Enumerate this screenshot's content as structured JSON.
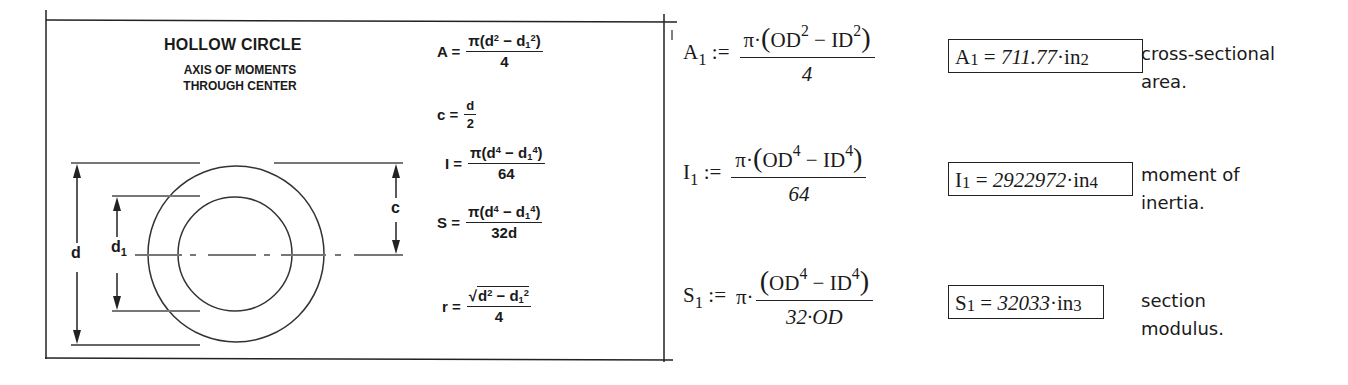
{
  "reference_panel": {
    "title": "HOLLOW CIRCLE",
    "subtitle_line1": "AXIS OF MOMENTS",
    "subtitle_line2": "THROUGH CENTER",
    "diagram_labels": {
      "d": "d",
      "d1_base": "d",
      "d1_sub": "1",
      "c": "c"
    },
    "formulas": {
      "A": {
        "lhs": "A =",
        "num_prefix": "π(d",
        "num_exp1": "2",
        "num_mid": " − d",
        "num_sub": "1",
        "num_exp2": "2",
        "num_suffix": ")",
        "den": "4"
      },
      "c": {
        "lhs": "c =",
        "num": "d",
        "den": "2"
      },
      "I": {
        "lhs": "I =",
        "num_prefix": "π(d",
        "num_exp1": "4",
        "num_mid": " − d",
        "num_sub": "1",
        "num_exp2": "4",
        "num_suffix": ")",
        "den": "64"
      },
      "S": {
        "lhs": "S =",
        "num_prefix": "π(d",
        "num_exp1": "4",
        "num_mid": " − d",
        "num_sub": "1",
        "num_exp2": "4",
        "num_suffix": ")",
        "den": "32d"
      },
      "r": {
        "lhs": "r =",
        "radical": "√",
        "num_prefix": "d",
        "num_exp1": "2",
        "num_mid": " − d",
        "num_sub": "1",
        "num_exp2": "2",
        "den": "4"
      }
    }
  },
  "calculations": [
    {
      "lhs_base": "A",
      "lhs_sub": "1",
      "assign": ":=",
      "prefix": "",
      "num": {
        "lead": "π·",
        "open": "(",
        "a": "OD",
        "a_exp": "2",
        "minus": " − ",
        "b": "ID",
        "b_exp": "2",
        "close": ")"
      },
      "den": "4",
      "result": {
        "base": "A",
        "sub": "1",
        "eq": " = ",
        "value": "711.77",
        "unit": "·in",
        "unit_exp": "2"
      },
      "note_line1": "cross-sectional",
      "note_line2": "area."
    },
    {
      "lhs_base": "I",
      "lhs_sub": "1",
      "assign": ":=",
      "prefix": "",
      "num": {
        "lead": "π·",
        "open": "(",
        "a": "OD",
        "a_exp": "4",
        "minus": " − ",
        "b": "ID",
        "b_exp": "4",
        "close": ")"
      },
      "den": "64",
      "result": {
        "base": "I",
        "sub": "1",
        "eq": " = ",
        "value": "2922972",
        "unit": "·in",
        "unit_exp": "4"
      },
      "note_line1": "moment of",
      "note_line2": "inertia."
    },
    {
      "lhs_base": "S",
      "lhs_sub": "1",
      "assign": ":=",
      "prefix": "π·",
      "num": {
        "lead": "",
        "open": "(",
        "a": "OD",
        "a_exp": "4",
        "minus": " − ",
        "b": "ID",
        "b_exp": "4",
        "close": ")"
      },
      "den": "32·OD",
      "result": {
        "base": "S",
        "sub": "1",
        "eq": " = ",
        "value": "32033",
        "unit": "·in",
        "unit_exp": "3"
      },
      "note_line1": "section",
      "note_line2": "modulus."
    }
  ]
}
